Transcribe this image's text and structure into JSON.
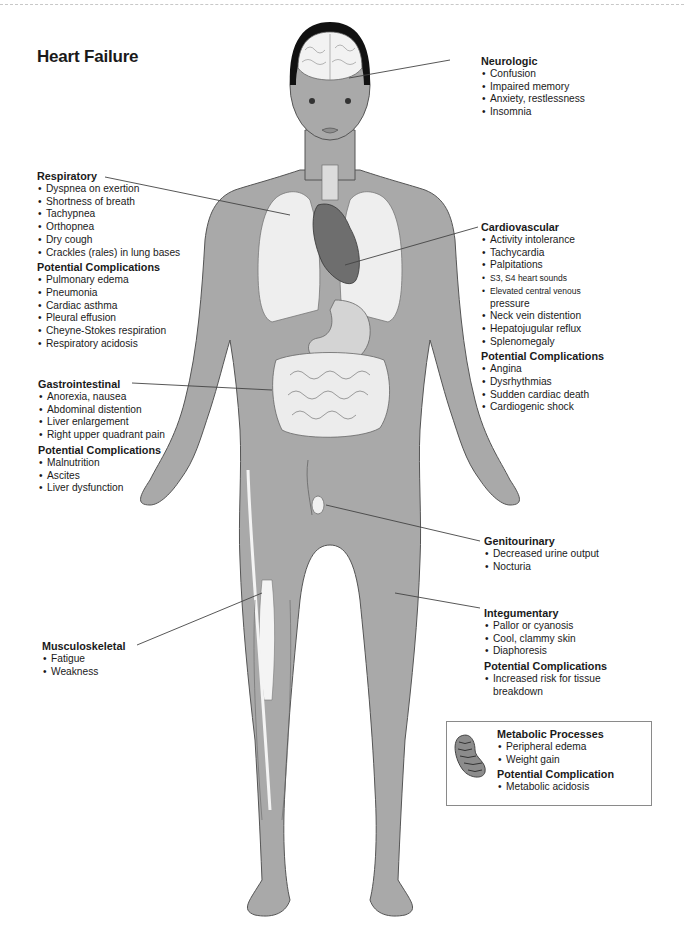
{
  "title": "Heart Failure",
  "systems": {
    "neurologic": {
      "heading": "Neurologic",
      "items": [
        "Confusion",
        "Impaired memory",
        "Anxiety, restlessness",
        "Insomnia"
      ]
    },
    "respiratory": {
      "heading": "Respiratory",
      "items": [
        "Dyspnea on exertion",
        "Shortness of breath",
        "Tachypnea",
        "Orthopnea",
        "Dry cough",
        "Crackles (rales) in lung bases"
      ],
      "complications_heading": "Potential Complications",
      "complications": [
        "Pulmonary edema",
        "Pneumonia",
        "Cardiac asthma",
        "Pleural effusion",
        "Cheyne-Stokes respiration",
        "Respiratory acidosis"
      ]
    },
    "cardiovascular": {
      "heading": "Cardiovascular",
      "items": [
        "Activity intolerance",
        "Tachycardia",
        "Palpitations",
        "S3, S4 heart sounds",
        "Elevated central venous",
        "pressure",
        "Neck vein distention",
        "Hepatojugular reflux",
        "Splenomegaly"
      ],
      "complications_heading": "Potential Complications",
      "complications": [
        "Angina",
        "Dysrhythmias",
        "Sudden cardiac death",
        "Cardiogenic shock"
      ]
    },
    "gastrointestinal": {
      "heading": "Gastrointestinal",
      "items": [
        "Anorexia, nausea",
        "Abdominal distention",
        "Liver enlargement",
        "Right upper quadrant pain"
      ],
      "complications_heading": "Potential Complications",
      "complications": [
        "Malnutrition",
        "Ascites",
        "Liver dysfunction"
      ]
    },
    "genitourinary": {
      "heading": "Genitourinary",
      "items": [
        "Decreased urine output",
        "Nocturia"
      ]
    },
    "integumentary": {
      "heading": "Integumentary",
      "items": [
        "Pallor or cyanosis",
        "Cool, clammy skin",
        "Diaphoresis"
      ],
      "complications_heading": "Potential Complications",
      "complications": [
        "Increased risk for tissue",
        "breakdown"
      ]
    },
    "musculoskeletal": {
      "heading": "Musculoskeletal",
      "items": [
        "Fatigue",
        "Weakness"
      ]
    },
    "metabolic": {
      "heading": "Metabolic Processes",
      "items": [
        "Peripheral edema",
        "Weight gain"
      ],
      "complications_heading": "Potential Complication",
      "complications": [
        "Metabolic acidosis"
      ]
    }
  },
  "colors": {
    "skin": "#a9a9a9",
    "skin_outline": "#555555",
    "organ_light": "#eeeeee",
    "heart": "#6e6e6e",
    "hair": "#111111",
    "leader_line": "#444444"
  }
}
